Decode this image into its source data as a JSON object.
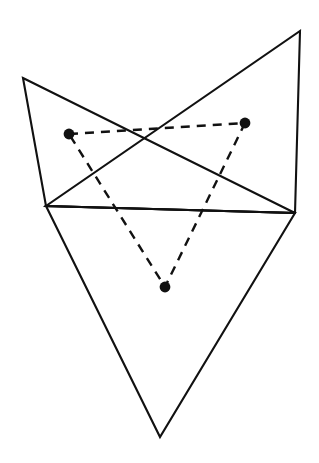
{
  "figure": {
    "background_color": "#ffffff",
    "canvas": {
      "width": 319,
      "height": 463
    },
    "styles": {
      "solid_stroke_color": "#111111",
      "solid_stroke_width": 2.1,
      "dashed_stroke_color": "#111111",
      "dashed_stroke_width": 2.4,
      "dash_pattern": "9 7",
      "dot_fill_color": "#111111",
      "dot_radius": 5.4
    },
    "solid_triangles": [
      {
        "name": "left-descending-triangle",
        "points": "23,78 295,213 46,206"
      },
      {
        "name": "right-ascending-triangle",
        "points": "300,31 295,213 46,206"
      },
      {
        "name": "lower-inverted-triangle",
        "points": "46,206 295,213 160,437"
      }
    ],
    "dashed_triangle": {
      "name": "inner-dashed-triangle",
      "points": "69,134 245,123 165,287"
    },
    "dots": [
      {
        "name": "dot-left",
        "cx": 69,
        "cy": 134
      },
      {
        "name": "dot-right",
        "cx": 245,
        "cy": 123
      },
      {
        "name": "dot-bottom",
        "cx": 165,
        "cy": 287
      }
    ]
  }
}
